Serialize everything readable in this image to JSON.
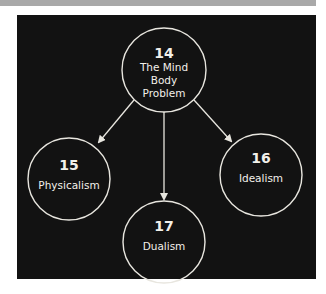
{
  "diagram": {
    "type": "concept-map",
    "colors": {
      "background": "#121212",
      "stroke": "#e8e6df",
      "text": "#f2f0ea",
      "page": "#ffffff",
      "top_band": "#a9a9a9"
    },
    "nodes": [
      {
        "id": "14",
        "number": "14",
        "label_lines": [
          "The Mind",
          "Body",
          "Problem"
        ]
      },
      {
        "id": "15",
        "number": "15",
        "label_lines": [
          "Physicalism"
        ]
      },
      {
        "id": "16",
        "number": "16",
        "label_lines": [
          "Idealism"
        ]
      },
      {
        "id": "17",
        "number": "17",
        "label_lines": [
          "Dualism"
        ]
      }
    ],
    "edges": [
      {
        "from": "14",
        "to": "15"
      },
      {
        "from": "14",
        "to": "17"
      },
      {
        "from": "14",
        "to": "16"
      }
    ]
  }
}
